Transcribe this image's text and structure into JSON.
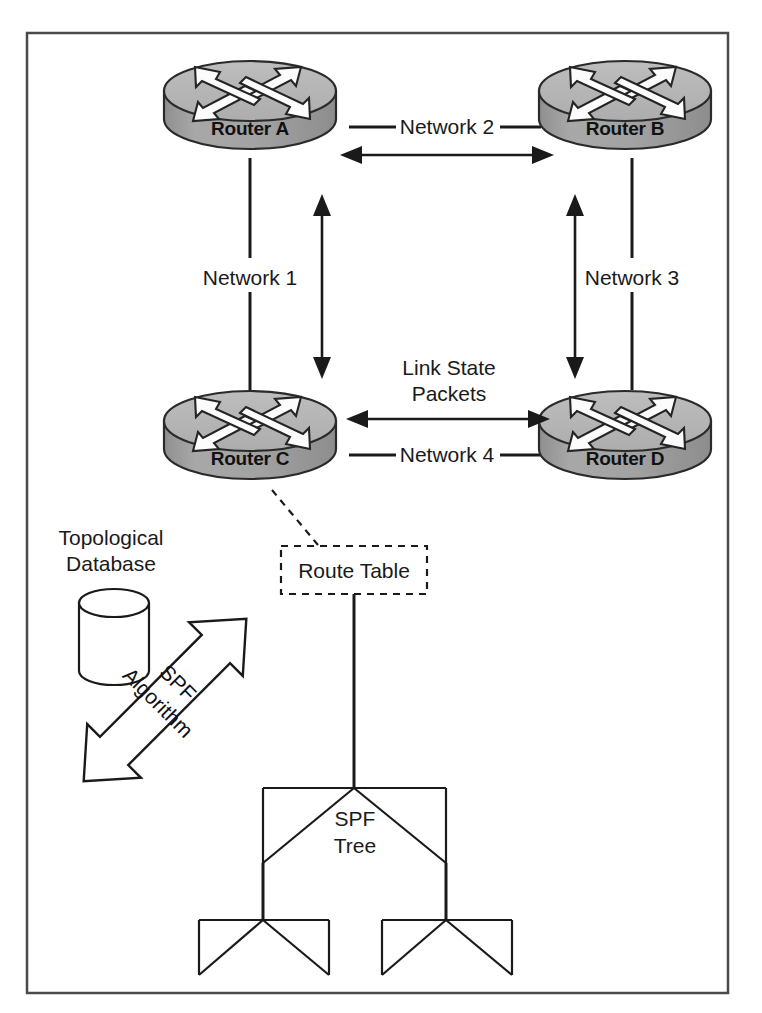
{
  "diagram": {
    "colors": {
      "router_top": "#b4b4b4",
      "router_side": "#9d9d9d",
      "router_outline": "#2a2a2a",
      "arrow_fill": "#fcfcfc",
      "line": "#1a1a1a",
      "frame": "#4a4a4a",
      "background": "#ffffff"
    },
    "routers": [
      {
        "id": "a",
        "label": "Router A",
        "cx": 250,
        "cy": 100
      },
      {
        "id": "b",
        "label": "Router B",
        "cx": 625,
        "cy": 100
      },
      {
        "id": "c",
        "label": "Router C",
        "cx": 250,
        "cy": 430
      },
      {
        "id": "d",
        "label": "Router D",
        "cx": 625,
        "cy": 430
      }
    ],
    "networks": [
      {
        "id": "net1",
        "label": "Network 1",
        "orientation": "vertical",
        "x": 250,
        "y": 278
      },
      {
        "id": "net2",
        "label": "Network 2",
        "orientation": "horizontal",
        "x": 447,
        "y": 127
      },
      {
        "id": "net3",
        "label": "Network 3",
        "orientation": "vertical",
        "x": 632,
        "y": 278
      },
      {
        "id": "net4",
        "label": "Network 4",
        "orientation": "horizontal",
        "x": 447,
        "y": 455
      }
    ],
    "annotations": {
      "link_state_packets": {
        "line1": "Link State",
        "line2": "Packets"
      },
      "topological_database": {
        "line1": "Topological",
        "line2": "Database"
      },
      "spf_algorithm": {
        "line1": "SPF",
        "line2": "Algorithm"
      },
      "route_table": "Route Table",
      "spf_tree": {
        "line1": "SPF",
        "line2": "Tree"
      }
    },
    "flow_arrows": [
      {
        "id": "lsp-a-b",
        "direction": "bidirectional",
        "axis": "horizontal"
      },
      {
        "id": "lsp-a-c",
        "direction": "bidirectional",
        "axis": "vertical"
      },
      {
        "id": "lsp-b-d",
        "direction": "bidirectional",
        "axis": "vertical"
      },
      {
        "id": "lsp-c-d",
        "direction": "bidirectional",
        "axis": "horizontal"
      }
    ]
  }
}
